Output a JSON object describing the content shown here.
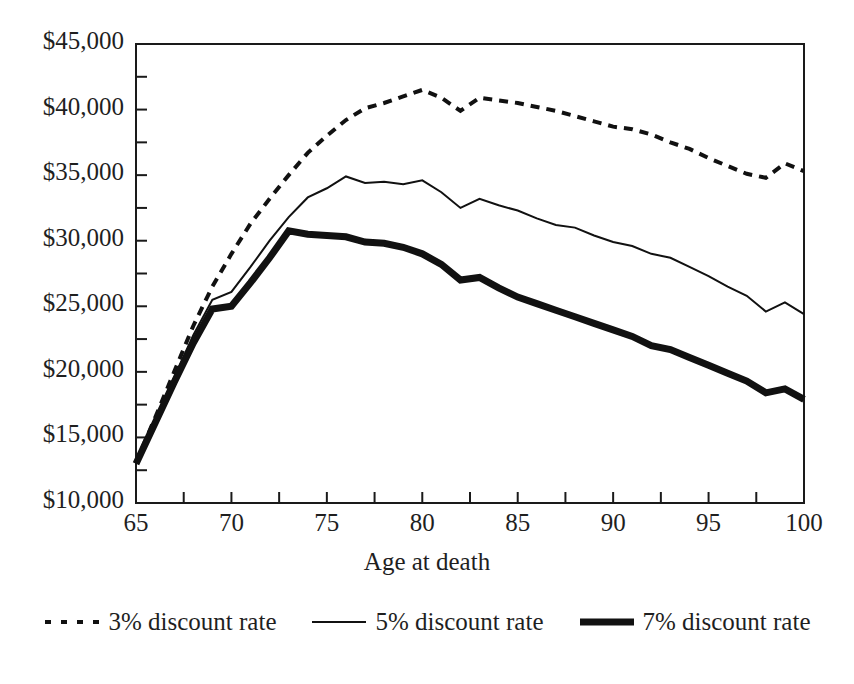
{
  "chart_data": {
    "type": "line",
    "title": "",
    "xlabel": "Age at death",
    "ylabel": "",
    "xlim": [
      65,
      100
    ],
    "ylim": [
      10000,
      45000
    ],
    "ytick_step": 5000,
    "yminor_step": 2500,
    "xtick_step": 5,
    "xminor_step": 2.5,
    "grid": false,
    "legend_position": "bottom",
    "y_tick_labels": [
      "$10,000",
      "$15,000",
      "$20,000",
      "$25,000",
      "$30,000",
      "$35,000",
      "$40,000",
      "$45,000"
    ],
    "y_tick_values": [
      10000,
      15000,
      20000,
      25000,
      30000,
      35000,
      40000,
      45000
    ],
    "x_tick_labels": [
      "65",
      "70",
      "75",
      "80",
      "85",
      "90",
      "95",
      "100"
    ],
    "x_tick_values": [
      65,
      70,
      75,
      80,
      85,
      90,
      95,
      100
    ],
    "x": [
      65,
      66,
      67,
      68,
      69,
      70,
      71,
      72,
      73,
      74,
      75,
      76,
      77,
      78,
      79,
      80,
      81,
      82,
      83,
      84,
      85,
      86,
      87,
      88,
      89,
      90,
      91,
      92,
      93,
      94,
      95,
      96,
      97,
      98,
      99,
      100
    ],
    "series": [
      {
        "name": "3% discount rate",
        "style": "dotted",
        "color": "#111111",
        "width": 4,
        "values": [
          13100,
          16500,
          20000,
          23500,
          26500,
          29000,
          31300,
          33200,
          35000,
          36700,
          38000,
          39200,
          40100,
          40500,
          41000,
          41500,
          40900,
          39900,
          40900,
          40700,
          40500,
          40200,
          39900,
          39500,
          39100,
          38700,
          38500,
          38100,
          37500,
          37000,
          36300,
          35700,
          35100,
          34800,
          35900,
          35300
        ]
      },
      {
        "name": "5% discount rate",
        "style": "solid-thin",
        "color": "#111111",
        "width": 2,
        "values": [
          13100,
          16300,
          19600,
          22800,
          25500,
          26100,
          28000,
          30000,
          31800,
          33300,
          34000,
          34900,
          34400,
          34500,
          34300,
          34600,
          33700,
          32500,
          33200,
          32700,
          32300,
          31700,
          31200,
          31000,
          30400,
          29900,
          29600,
          29000,
          28700,
          28000,
          27300,
          26500,
          25800,
          24600,
          25300,
          24400
        ]
      },
      {
        "name": "7% discount rate",
        "style": "solid-thick",
        "color": "#111111",
        "width": 7,
        "values": [
          13000,
          16100,
          19200,
          22200,
          24800,
          25000,
          26800,
          28700,
          30750,
          30500,
          30400,
          30300,
          29900,
          29800,
          29500,
          29000,
          28200,
          27000,
          27200,
          26400,
          25700,
          25200,
          24700,
          24200,
          23700,
          23200,
          22700,
          22000,
          21700,
          21100,
          20500,
          19900,
          19300,
          18400,
          18700,
          17900
        ]
      }
    ]
  },
  "legend": {
    "items": [
      {
        "label": "3% discount rate",
        "swatch": "dotted-line-swatch"
      },
      {
        "label": "5% discount rate",
        "swatch": "thin-line-swatch"
      },
      {
        "label": "7% discount rate",
        "swatch": "thick-line-swatch"
      }
    ]
  },
  "axes": {
    "x_title": "Age at death"
  }
}
